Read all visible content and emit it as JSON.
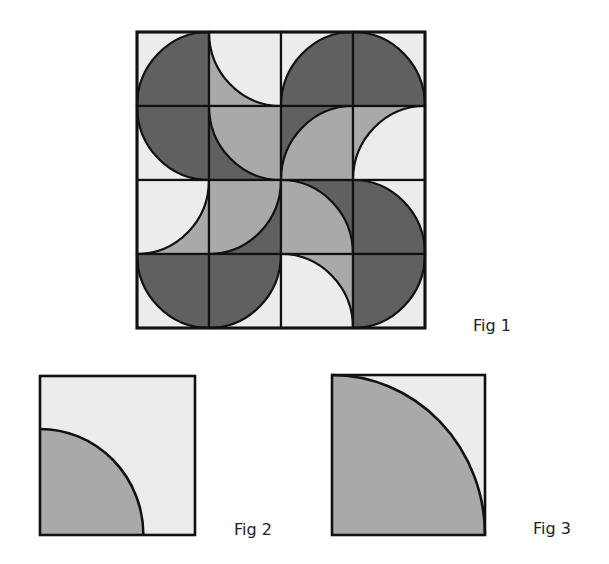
{
  "colors": {
    "dark": "#606060",
    "mid": "#a9a9a9",
    "light": "#ececec",
    "line": "#111111"
  },
  "figures": {
    "fig1": {
      "label": "Fig 1",
      "rows": 4,
      "cols": 4,
      "tiles": [
        [
          {
            "corner": "bottom-right",
            "arc": "dark",
            "bg": "light"
          },
          {
            "corner": "top-right",
            "arc": "light",
            "bg": "mid"
          },
          {
            "corner": "bottom-right",
            "arc": "dark",
            "bg": "light"
          },
          {
            "corner": "bottom-left",
            "arc": "dark",
            "bg": "light"
          }
        ],
        [
          {
            "corner": "top-right",
            "arc": "dark",
            "bg": "light"
          },
          {
            "corner": "top-right",
            "arc": "mid",
            "bg": "dark"
          },
          {
            "corner": "bottom-right",
            "arc": "mid",
            "bg": "dark"
          },
          {
            "corner": "bottom-right",
            "arc": "light",
            "bg": "mid"
          }
        ],
        [
          {
            "corner": "top-left",
            "arc": "light",
            "bg": "mid"
          },
          {
            "corner": "top-left",
            "arc": "mid",
            "bg": "dark"
          },
          {
            "corner": "bottom-left",
            "arc": "mid",
            "bg": "dark"
          },
          {
            "corner": "bottom-left",
            "arc": "dark",
            "bg": "light"
          }
        ],
        [
          {
            "corner": "top-right",
            "arc": "dark",
            "bg": "light"
          },
          {
            "corner": "top-left",
            "arc": "dark",
            "bg": "light"
          },
          {
            "corner": "bottom-left",
            "arc": "light",
            "bg": "mid"
          },
          {
            "corner": "top-left",
            "arc": "dark",
            "bg": "light"
          }
        ]
      ]
    },
    "fig2": {
      "label": "Fig 2",
      "tile": {
        "corner": "bottom-left",
        "arc": "mid",
        "bg": "light",
        "radius_fraction": 0.667
      }
    },
    "fig3": {
      "label": "Fig 3",
      "tile": {
        "corner": "bottom-left",
        "arc": "mid",
        "bg": "light",
        "radius_fraction": 1.0
      }
    }
  }
}
